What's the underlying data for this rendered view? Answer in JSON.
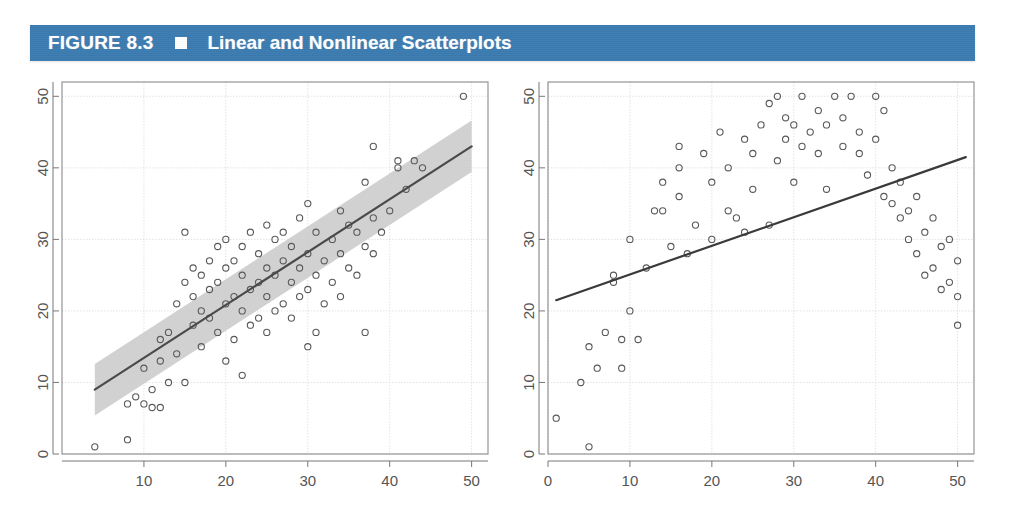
{
  "header": {
    "figure_label": "FIGURE 8.3",
    "bullet_icon": "white-square-marker",
    "title": "Linear and Nonlinear Scatterplots",
    "bar_color": "#3a7bb0",
    "text_color": "#ffffff"
  },
  "chart_data": [
    {
      "id": "left-scatterplot",
      "type": "scatter",
      "title": "",
      "subtitle": "Linear scatterplot with regression line and confidence band",
      "xlabel": "",
      "ylabel": "",
      "xlim": [
        0,
        52
      ],
      "ylim": [
        0,
        52
      ],
      "xticks": [
        10,
        20,
        30,
        40,
        50
      ],
      "yticks": [
        0,
        10,
        20,
        30,
        40,
        50
      ],
      "grid": true,
      "grid_color": "#dcdcdc",
      "frame_color": "#8a8a8a",
      "point_marker": "open-circle",
      "point_color": "#595959",
      "legend": "none",
      "fit_line": {
        "type": "linear",
        "color": "#4a4a4a",
        "x": [
          4,
          50
        ],
        "y": [
          9.0,
          43.0
        ],
        "slope": 0.739,
        "intercept": 6.04
      },
      "confidence_band": {
        "color": "#c9c9c9",
        "opacity": 0.85,
        "half_width": 3.6,
        "description": "shaded gray band around the regression line"
      },
      "points": [
        [
          4,
          1
        ],
        [
          8,
          2
        ],
        [
          8,
          7
        ],
        [
          9,
          8
        ],
        [
          10,
          7
        ],
        [
          10,
          12
        ],
        [
          11,
          9
        ],
        [
          11,
          6.5
        ],
        [
          12,
          6.5
        ],
        [
          12,
          13
        ],
        [
          12,
          16
        ],
        [
          13,
          10
        ],
        [
          13,
          17
        ],
        [
          14,
          14
        ],
        [
          14,
          21
        ],
        [
          15,
          10
        ],
        [
          15,
          24
        ],
        [
          15,
          31
        ],
        [
          16,
          18
        ],
        [
          16,
          22
        ],
        [
          16,
          26
        ],
        [
          17,
          15
        ],
        [
          17,
          20
        ],
        [
          17,
          25
        ],
        [
          18,
          19
        ],
        [
          18,
          23
        ],
        [
          18,
          27
        ],
        [
          19,
          17
        ],
        [
          19,
          24
        ],
        [
          19,
          29
        ],
        [
          20,
          13
        ],
        [
          20,
          21
        ],
        [
          20,
          26
        ],
        [
          20,
          30
        ],
        [
          21,
          16
        ],
        [
          21,
          22
        ],
        [
          21,
          27
        ],
        [
          22,
          11
        ],
        [
          22,
          20
        ],
        [
          22,
          25
        ],
        [
          22,
          29
        ],
        [
          23,
          18
        ],
        [
          23,
          23
        ],
        [
          23,
          31
        ],
        [
          24,
          19
        ],
        [
          24,
          24
        ],
        [
          24,
          28
        ],
        [
          25,
          17
        ],
        [
          25,
          22
        ],
        [
          25,
          26
        ],
        [
          25,
          32
        ],
        [
          26,
          20
        ],
        [
          26,
          25
        ],
        [
          26,
          30
        ],
        [
          27,
          21
        ],
        [
          27,
          27
        ],
        [
          27,
          31
        ],
        [
          28,
          19
        ],
        [
          28,
          24
        ],
        [
          28,
          29
        ],
        [
          29,
          22
        ],
        [
          29,
          26
        ],
        [
          29,
          33
        ],
        [
          30,
          15
        ],
        [
          30,
          23
        ],
        [
          30,
          28
        ],
        [
          30,
          35
        ],
        [
          31,
          17
        ],
        [
          31,
          25
        ],
        [
          31,
          31
        ],
        [
          32,
          21
        ],
        [
          32,
          27
        ],
        [
          33,
          24
        ],
        [
          33,
          30
        ],
        [
          34,
          22
        ],
        [
          34,
          28
        ],
        [
          34,
          34
        ],
        [
          35,
          26
        ],
        [
          35,
          32
        ],
        [
          36,
          25
        ],
        [
          36,
          31
        ],
        [
          37,
          17
        ],
        [
          37,
          29
        ],
        [
          37,
          38
        ],
        [
          38,
          28
        ],
        [
          38,
          33
        ],
        [
          38,
          43
        ],
        [
          39,
          31
        ],
        [
          40,
          34
        ],
        [
          41,
          40
        ],
        [
          41,
          41
        ],
        [
          42,
          37
        ],
        [
          43,
          41
        ],
        [
          44,
          40
        ],
        [
          49,
          50
        ]
      ]
    },
    {
      "id": "right-scatterplot",
      "type": "scatter",
      "title": "",
      "subtitle": "Nonlinear (inverted-U) scatterplot with misleading straight fit line",
      "xlabel": "",
      "ylabel": "",
      "xlim": [
        0,
        52
      ],
      "ylim": [
        0,
        52
      ],
      "xticks": [
        0,
        10,
        20,
        30,
        40,
        50
      ],
      "yticks": [
        0,
        10,
        20,
        30,
        40,
        50
      ],
      "grid": true,
      "grid_color": "#dcdcdc",
      "frame_color": "#8a8a8a",
      "point_marker": "open-circle",
      "point_color": "#595959",
      "legend": "none",
      "fit_line": {
        "type": "linear",
        "color": "#3a3a3a",
        "x": [
          1,
          51
        ],
        "y": [
          21.5,
          41.5
        ],
        "slope": 0.4,
        "intercept": 21.1
      },
      "confidence_band": null,
      "points": [
        [
          1,
          5
        ],
        [
          4,
          10
        ],
        [
          5,
          1
        ],
        [
          5,
          15
        ],
        [
          6,
          12
        ],
        [
          7,
          17
        ],
        [
          8,
          24
        ],
        [
          8,
          25
        ],
        [
          9,
          12
        ],
        [
          9,
          16
        ],
        [
          10,
          20
        ],
        [
          10,
          30
        ],
        [
          11,
          16
        ],
        [
          12,
          26
        ],
        [
          13,
          34
        ],
        [
          14,
          34
        ],
        [
          14,
          38
        ],
        [
          15,
          29
        ],
        [
          16,
          36
        ],
        [
          16,
          40
        ],
        [
          16,
          43
        ],
        [
          17,
          28
        ],
        [
          18,
          32
        ],
        [
          19,
          42
        ],
        [
          20,
          30
        ],
        [
          20,
          38
        ],
        [
          21,
          45
        ],
        [
          22,
          34
        ],
        [
          22,
          40
        ],
        [
          23,
          33
        ],
        [
          24,
          31
        ],
        [
          24,
          44
        ],
        [
          25,
          37
        ],
        [
          25,
          42
        ],
        [
          26,
          46
        ],
        [
          27,
          32
        ],
        [
          27,
          49
        ],
        [
          28,
          41
        ],
        [
          28,
          50
        ],
        [
          29,
          44
        ],
        [
          29,
          47
        ],
        [
          30,
          38
        ],
        [
          30,
          46
        ],
        [
          31,
          43
        ],
        [
          31,
          50
        ],
        [
          32,
          45
        ],
        [
          33,
          42
        ],
        [
          33,
          48
        ],
        [
          34,
          37
        ],
        [
          34,
          46
        ],
        [
          35,
          50
        ],
        [
          36,
          43
        ],
        [
          36,
          47
        ],
        [
          37,
          50
        ],
        [
          38,
          42
        ],
        [
          38,
          45
        ],
        [
          39,
          39
        ],
        [
          40,
          44
        ],
        [
          40,
          50
        ],
        [
          41,
          36
        ],
        [
          41,
          48
        ],
        [
          42,
          40
        ],
        [
          42,
          35
        ],
        [
          43,
          33
        ],
        [
          43,
          38
        ],
        [
          44,
          30
        ],
        [
          44,
          34
        ],
        [
          45,
          28
        ],
        [
          45,
          36
        ],
        [
          46,
          31
        ],
        [
          46,
          25
        ],
        [
          47,
          33
        ],
        [
          47,
          26
        ],
        [
          48,
          23
        ],
        [
          48,
          29
        ],
        [
          49,
          24
        ],
        [
          49,
          30
        ],
        [
          50,
          22
        ],
        [
          50,
          27
        ],
        [
          50,
          18
        ]
      ]
    }
  ]
}
